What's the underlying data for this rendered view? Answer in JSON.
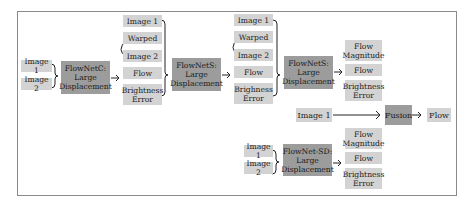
{
  "diagram": {
    "stage1": {
      "inputs": [
        "Image 1",
        "Image 2"
      ],
      "network": "FlowNetC:\nLarge\nDisplacement",
      "outputs": [
        "Image 1",
        "Warped",
        "Image 2",
        "Flow",
        "Brightness\nError"
      ]
    },
    "stage2": {
      "network": "FlowNetS:\nLarge\nDisplacement",
      "outputs": [
        "Image 1",
        "Warped",
        "Image 2",
        "Flow",
        "Brighness\nError"
      ]
    },
    "stage3": {
      "network": "FlowNetS:\nLarge\nDisplacement",
      "outputs": [
        "Flow\nMagnitude",
        "Flow",
        "Brightness\nError"
      ]
    },
    "fusion": {
      "input": "Image 1",
      "label": "Fusion",
      "output": "Flow"
    },
    "small_branch": {
      "inputs": [
        "Image 1",
        "Image 2"
      ],
      "network": "FlowNet-SD:\nLarge\nDisplacement",
      "outputs": [
        "Flow\nMagnitude",
        "Flow",
        "Brightness\nError"
      ]
    },
    "colors": {
      "light_box": "#d3d3d3",
      "dark_box": "#9c9c9c",
      "frame": "#8a8a8a"
    }
  }
}
